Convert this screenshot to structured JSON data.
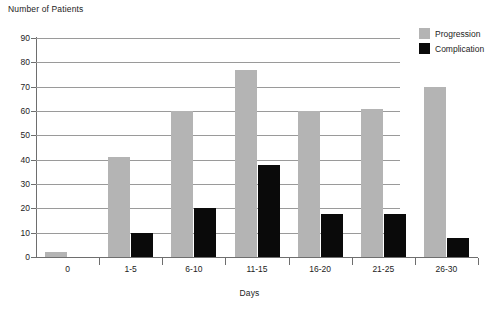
{
  "chart_data": {
    "type": "bar",
    "title": "",
    "ylabel": "Number of Patients",
    "xlabel": "Days",
    "categories": [
      "0",
      "1-5",
      "6-10",
      "11-15",
      "16-20",
      "21-25",
      "26-30"
    ],
    "series": [
      {
        "name": "Progression",
        "color": "#b4b4b4",
        "values": [
          2,
          41,
          60,
          77,
          60,
          61,
          70
        ]
      },
      {
        "name": "Complication",
        "color": "#0a0a0a",
        "values": [
          0,
          10,
          20,
          38,
          17.5,
          17.5,
          8
        ]
      }
    ],
    "ylim": [
      0,
      90
    ],
    "ytick_step": 10,
    "yticks": [
      "0",
      "10",
      "20",
      "30",
      "40",
      "50",
      "60",
      "70",
      "80",
      "90"
    ],
    "grid": true,
    "legend_position": "top-right"
  },
  "legend": {
    "items": [
      {
        "label": "Progression",
        "color": "#b4b4b4"
      },
      {
        "label": "Complication",
        "color": "#0a0a0a"
      }
    ]
  }
}
